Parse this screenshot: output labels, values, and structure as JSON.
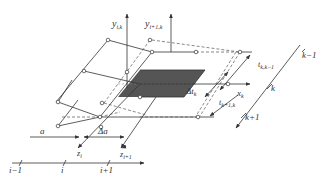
{
  "diagram": {
    "axes": {
      "y_i_k": {
        "label": "y",
        "sub": "i,k"
      },
      "y_i1_k": {
        "label": "y",
        "sub": "i+1,k"
      },
      "x_k": {
        "label": "x",
        "sub": "k"
      },
      "z_i": {
        "label": "z",
        "sub": "i"
      },
      "z_i1": {
        "label": "z",
        "sub": "i+1"
      }
    },
    "dimensions": {
      "a": "a",
      "delta_a": "Δa",
      "delta_t_k": {
        "label": "Δt",
        "sub": "k"
      },
      "t_k_k1": {
        "label": "t",
        "sub": "k,k−1"
      },
      "t_k1_k": {
        "label": "t",
        "sub": "k+1,k"
      }
    },
    "i_axis": {
      "ticks": [
        "i−1",
        "i",
        "i+1"
      ]
    },
    "k_axis": {
      "ticks": [
        "k−1",
        "k",
        "k+1"
      ]
    },
    "colors": {
      "line": "#333333",
      "shaded": "#555555",
      "dashed": "#555555"
    }
  }
}
